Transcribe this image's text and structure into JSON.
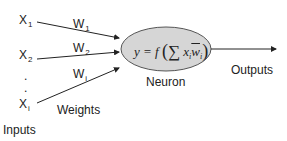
{
  "diagram": {
    "type": "perceptron-neuron",
    "inputs": [
      {
        "label": "X",
        "sub": "1"
      },
      {
        "label": "X",
        "sub": "2"
      },
      {
        "label": "X",
        "sub": "i"
      }
    ],
    "ellipsis": ".",
    "weights": [
      {
        "label": "W",
        "sub": "1"
      },
      {
        "label": "W",
        "sub": "2"
      },
      {
        "label": "W",
        "sub": "i"
      }
    ],
    "inputs_caption": "Inputs",
    "weights_caption": "Weights",
    "neuron": {
      "caption": "Neuron",
      "formula": {
        "lhs": "y = f",
        "open": "(",
        "sigma": "∑",
        "term_x": "x",
        "term_x_sub": "i",
        "term_w": "w",
        "term_w_sub": "i",
        "close": ")"
      },
      "fill": "#d6d6d6",
      "stroke": "#555555"
    },
    "output_caption": "Outputs"
  }
}
